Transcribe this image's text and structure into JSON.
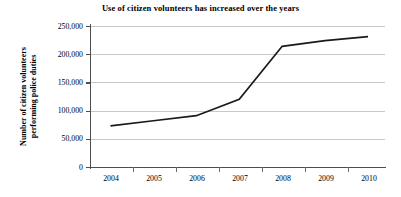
{
  "chart_data": {
    "type": "line",
    "title": "Use of citizen volunteers has increased over the years",
    "xlabel": "",
    "ylabel": "Number of citizen volunteers performing police duties",
    "ylabel_line1": "Number of citizen volunteers",
    "ylabel_line2": "performing police duties",
    "categories": [
      "2004",
      "2005",
      "2006",
      "2007",
      "2008",
      "2009",
      "2010"
    ],
    "values": [
      73000,
      82000,
      91000,
      120000,
      214000,
      224000,
      231000
    ],
    "series": [
      {
        "name": "Number of citizen volunteers performing police duties",
        "values": [
          73000,
          82000,
          91000,
          120000,
          214000,
          224000,
          231000
        ]
      }
    ],
    "ylim": [
      0,
      250000
    ],
    "ytick_values": [
      0,
      50000,
      100000,
      150000,
      200000,
      250000
    ],
    "ytick_labels": [
      "0",
      "50,000",
      "100,000",
      "150,000",
      "200,000",
      "250,000"
    ],
    "grid": true,
    "legend": "none",
    "line_color": "#1a1a1a",
    "grid_color": "#c8c8c8",
    "axis_color": "#4d4d4d",
    "background_color": "#ffffff"
  }
}
